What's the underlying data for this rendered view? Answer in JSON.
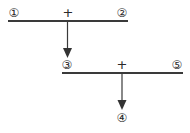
{
  "diagram": {
    "row1": {
      "left": "①",
      "op": "+",
      "right": "②"
    },
    "row2": {
      "left": "③",
      "op": "+",
      "right": "⑤"
    },
    "result": "④"
  }
}
